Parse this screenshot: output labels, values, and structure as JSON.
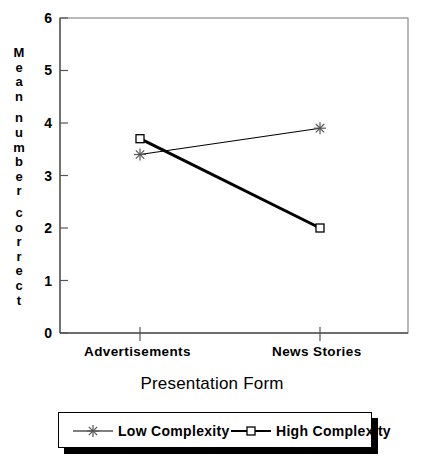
{
  "chart_data": {
    "type": "line",
    "title": "",
    "xlabel": "Presentation Form",
    "ylabel": "Mean number correct",
    "categories": [
      "Advertisements",
      "News Stories"
    ],
    "ylim": [
      0,
      6
    ],
    "yticks": [
      0,
      1,
      2,
      3,
      4,
      5,
      6
    ],
    "ytick_labels": [
      "0",
      "1",
      "2",
      "3",
      "4",
      "5",
      "6"
    ],
    "grid": false,
    "legend_position": "below-plot",
    "series": [
      {
        "name": "Low Complexity",
        "marker": "asterisk",
        "line_width": "thin",
        "color": "#000000",
        "values": [
          3.4,
          3.9
        ]
      },
      {
        "name": "High Complexity",
        "marker": "open-square",
        "line_width": "thick",
        "color": "#000000",
        "values": [
          3.7,
          2.0
        ]
      }
    ]
  },
  "axis": {
    "y_label_chars": [
      "M",
      "e",
      "a",
      "n",
      "",
      "n",
      "u",
      "m",
      "b",
      "e",
      "r",
      "",
      "c",
      "o",
      "r",
      "r",
      "e",
      "c",
      "t"
    ]
  },
  "legend": {
    "items": [
      {
        "label": "Low Complexity"
      },
      {
        "label": "High Complexity"
      }
    ]
  }
}
